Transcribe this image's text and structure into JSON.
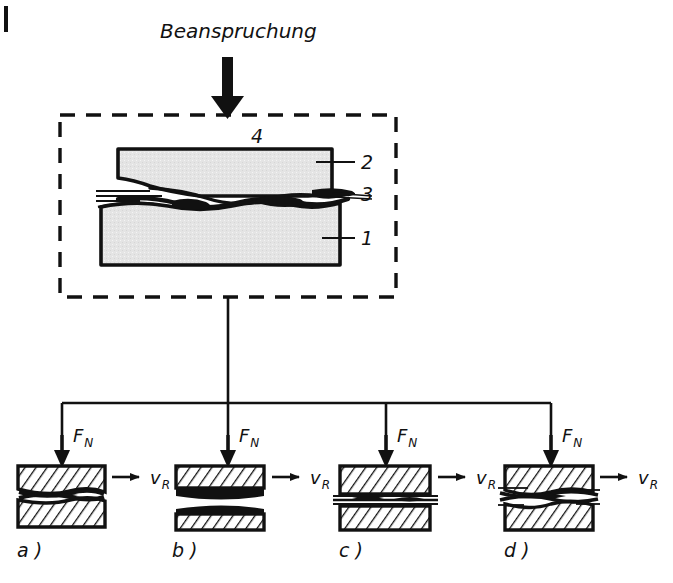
{
  "figure": {
    "title": "Beanspruchung",
    "edge_marker": "left-page-edge-rule",
    "main_box": {
      "name": "tribological-system-box",
      "style": "dashed",
      "callouts": [
        {
          "id": "4",
          "label": "4",
          "target": "interface-top-gap"
        },
        {
          "id": "2",
          "label": "2",
          "target": "upper-body"
        },
        {
          "id": "3",
          "label": "3",
          "target": "intermediate-material"
        },
        {
          "id": "1",
          "label": "1",
          "target": "lower-body"
        }
      ]
    },
    "panels": [
      {
        "key": "a",
        "label": "a )",
        "force_label": "F",
        "force_sub": "N",
        "velocity_label": "v",
        "velocity_sub": "R",
        "interface": "wavy-contact"
      },
      {
        "key": "b",
        "label": "b )",
        "force_label": "F",
        "force_sub": "N",
        "velocity_label": "v",
        "velocity_sub": "R",
        "interface": "separated-thick-film"
      },
      {
        "key": "c",
        "label": "c )",
        "force_label": "F",
        "force_sub": "N",
        "velocity_label": "v",
        "velocity_sub": "R",
        "interface": "thin-streaky-film"
      },
      {
        "key": "d",
        "label": "d )",
        "force_label": "F",
        "force_sub": "N",
        "velocity_label": "v",
        "velocity_sub": "R",
        "interface": "wavy-streaky-contact"
      }
    ],
    "colors": {
      "ink": "#111111",
      "body_fill": "#e2e2e2",
      "paper": "#ffffff"
    }
  }
}
